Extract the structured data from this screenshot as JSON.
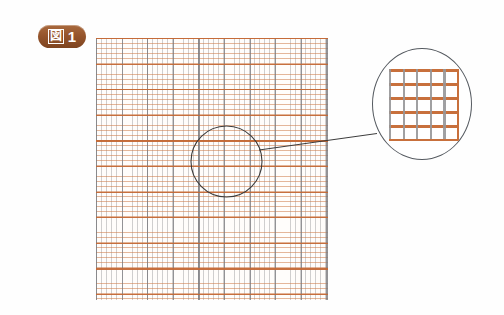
{
  "figure": {
    "label_kanji": "図",
    "label_number": "1",
    "badge_color": "#96552c",
    "badge_text_color": "#ffffff"
  },
  "diagram": {
    "type": "graph-paper-magnification",
    "grid": {
      "name": "graph-paper",
      "background_color": "#fffdfb",
      "horizontal_line_color": "#c46834",
      "vertical_line_color": "#96969a",
      "fine_cell_px": 5,
      "bold_every_n_cells": 5,
      "width_px": 232,
      "height_px": 262,
      "fine_columns": 46,
      "fine_rows": 52
    },
    "selection_circle": {
      "name": "selection-circle",
      "center_x": 226,
      "center_y": 161,
      "radius": 35,
      "stroke_color": "#3c3c3c"
    },
    "connector": {
      "name": "connector-line",
      "from_x": 259,
      "from_y": 150,
      "to_x": 376,
      "to_y": 134,
      "stroke_color": "#3c3c3c"
    },
    "magnifier": {
      "name": "magnifier-circle",
      "center_x": 421,
      "center_y": 103,
      "radius_x": 49,
      "radius_y": 55,
      "stroke_color": "#555a60",
      "background_color": "#ffffff",
      "zoom_grid": {
        "columns": 5,
        "rows": 5,
        "horizontal_line_color": "#c8703c",
        "vertical_line_color": "#96969a"
      }
    }
  }
}
